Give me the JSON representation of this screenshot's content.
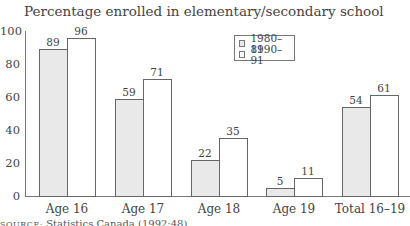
{
  "chart_data": {
    "type": "bar",
    "title": "Percentage enrolled in elementary/secondary school",
    "xlabel": "",
    "ylabel": "",
    "ylim": [
      0,
      100
    ],
    "yticks": [
      0,
      20,
      40,
      60,
      80,
      100
    ],
    "categories": [
      "Age 16",
      "Age 17",
      "Age 18",
      "Age 19",
      "Total 16–19"
    ],
    "series": [
      {
        "name": "1980–81",
        "color": "#e9e9e9",
        "values": [
          89,
          59,
          22,
          5,
          54
        ]
      },
      {
        "name": "1990–91",
        "color": "#ffffff",
        "values": [
          96,
          71,
          35,
          11,
          61
        ]
      }
    ],
    "grid": false,
    "legend_position": "upper right (inside plot)",
    "data_labels": true
  },
  "legend": {
    "items": [
      {
        "label": "1980–81"
      },
      {
        "label": "1990–91"
      }
    ]
  },
  "source": {
    "prefix": "SOURCE:",
    "text": " Statistics Canada (1992:48)"
  }
}
